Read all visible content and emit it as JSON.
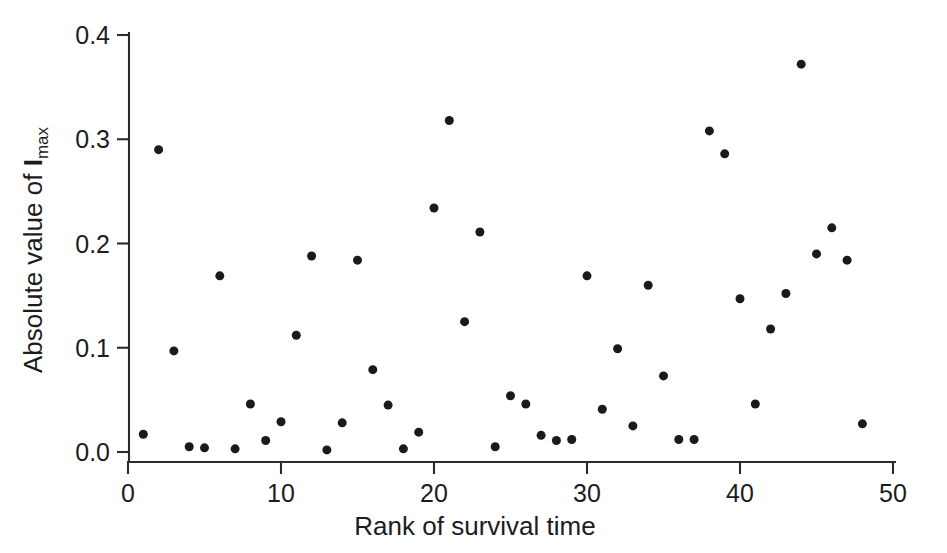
{
  "chart_data": {
    "type": "scatter",
    "title": "",
    "xlabel": "Rank of survival time",
    "ylabel_prefix": "Absolute value of ",
    "ylabel_var": "I",
    "ylabel_sub": "max",
    "ylabel_full": "Absolute value of Imax",
    "xlim": [
      0,
      50
    ],
    "ylim": [
      0.0,
      0.4
    ],
    "xticks": [
      0,
      10,
      20,
      30,
      40,
      50
    ],
    "xtick_labels": [
      "0",
      "10",
      "20",
      "30",
      "40",
      "50"
    ],
    "yticks": [
      0.0,
      0.1,
      0.2,
      0.3,
      0.4
    ],
    "ytick_labels": [
      "0.0",
      "0.1",
      "0.2",
      "0.3",
      "0.4"
    ],
    "grid": false,
    "legend": false,
    "marker": "filled-circle",
    "marker_color": "#1a1a1a",
    "marker_size_px": 9,
    "axis_color": "#2b2b2b",
    "background_color": "#ffffff",
    "x": [
      1,
      2,
      3,
      4,
      5,
      6,
      7,
      8,
      9,
      10,
      11,
      12,
      13,
      14,
      15,
      16,
      17,
      18,
      19,
      20,
      21,
      22,
      23,
      24,
      25,
      26,
      27,
      28,
      29,
      30,
      31,
      32,
      33,
      34,
      35,
      36,
      37,
      38,
      39,
      40,
      41,
      42,
      43,
      44,
      45,
      46,
      47,
      48
    ],
    "y": [
      0.017,
      0.29,
      0.097,
      0.005,
      0.004,
      0.169,
      0.003,
      0.046,
      0.011,
      0.029,
      0.112,
      0.188,
      0.002,
      0.028,
      0.184,
      0.079,
      0.045,
      0.003,
      0.019,
      0.234,
      0.318,
      0.125,
      0.211,
      0.005,
      0.054,
      0.046,
      0.016,
      0.011,
      0.012,
      0.169,
      0.041,
      0.099,
      0.025,
      0.16,
      0.073,
      0.012,
      0.012,
      0.308,
      0.286,
      0.147,
      0.046,
      0.118,
      0.152,
      0.372,
      0.19,
      0.215,
      0.184,
      0.027
    ],
    "points": [
      {
        "rank": 1,
        "value": 0.017
      },
      {
        "rank": 2,
        "value": 0.29
      },
      {
        "rank": 3,
        "value": 0.097
      },
      {
        "rank": 4,
        "value": 0.005
      },
      {
        "rank": 5,
        "value": 0.004
      },
      {
        "rank": 6,
        "value": 0.169
      },
      {
        "rank": 7,
        "value": 0.003
      },
      {
        "rank": 8,
        "value": 0.046
      },
      {
        "rank": 9,
        "value": 0.011
      },
      {
        "rank": 10,
        "value": 0.029
      },
      {
        "rank": 11,
        "value": 0.112
      },
      {
        "rank": 12,
        "value": 0.188
      },
      {
        "rank": 13,
        "value": 0.002
      },
      {
        "rank": 14,
        "value": 0.028
      },
      {
        "rank": 15,
        "value": 0.184
      },
      {
        "rank": 16,
        "value": 0.079
      },
      {
        "rank": 17,
        "value": 0.045
      },
      {
        "rank": 18,
        "value": 0.003
      },
      {
        "rank": 19,
        "value": 0.019
      },
      {
        "rank": 20,
        "value": 0.234
      },
      {
        "rank": 21,
        "value": 0.318
      },
      {
        "rank": 22,
        "value": 0.125
      },
      {
        "rank": 23,
        "value": 0.211
      },
      {
        "rank": 24,
        "value": 0.005
      },
      {
        "rank": 25,
        "value": 0.054
      },
      {
        "rank": 26,
        "value": 0.046
      },
      {
        "rank": 27,
        "value": 0.016
      },
      {
        "rank": 28,
        "value": 0.011
      },
      {
        "rank": 29,
        "value": 0.012
      },
      {
        "rank": 30,
        "value": 0.169
      },
      {
        "rank": 31,
        "value": 0.041
      },
      {
        "rank": 32,
        "value": 0.099
      },
      {
        "rank": 33,
        "value": 0.025
      },
      {
        "rank": 34,
        "value": 0.16
      },
      {
        "rank": 35,
        "value": 0.073
      },
      {
        "rank": 36,
        "value": 0.012
      },
      {
        "rank": 37,
        "value": 0.012
      },
      {
        "rank": 38,
        "value": 0.308
      },
      {
        "rank": 39,
        "value": 0.286
      },
      {
        "rank": 40,
        "value": 0.147
      },
      {
        "rank": 41,
        "value": 0.046
      },
      {
        "rank": 42,
        "value": 0.118
      },
      {
        "rank": 43,
        "value": 0.152
      },
      {
        "rank": 44,
        "value": 0.372
      },
      {
        "rank": 45,
        "value": 0.19
      },
      {
        "rank": 46,
        "value": 0.215
      },
      {
        "rank": 47,
        "value": 0.184
      },
      {
        "rank": 48,
        "value": 0.027
      }
    ]
  },
  "geometry": {
    "plot_left_px": 128,
    "plot_right_px": 893,
    "plot_bottom_px": 452,
    "plot_top_px": 35,
    "axis_baseline_px": 462
  }
}
